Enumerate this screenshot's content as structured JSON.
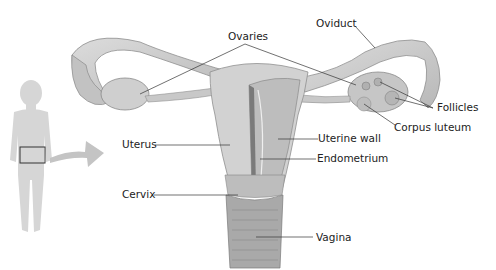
{
  "diagram": {
    "labels": {
      "ovaries": "Ovaries",
      "oviduct": "Oviduct",
      "follicles": "Follicles",
      "corpus_luteum": "Corpus luteum",
      "uterus": "Uterus",
      "uterine_wall": "Uterine wall",
      "endometrium": "Endometrium",
      "cervix": "Cervix",
      "vagina": "Vagina"
    },
    "colors": {
      "tissue": "#c9c9c9",
      "tissue_dark": "#8f8f8f",
      "silhouette": "#d4d4d4",
      "arrow": "#c4c4c4",
      "leader_line": "#333333"
    }
  }
}
